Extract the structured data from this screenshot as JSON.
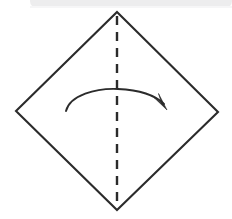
{
  "figure": {
    "title": "Origami fold step: fold square diamond in half along vertical crease",
    "canvas": {
      "width": 232,
      "height": 219,
      "background": "#ffffff"
    },
    "top_band": {
      "name": "page-edge-band",
      "description": "light gray rounded scanned page edge strip along the top",
      "x": 30,
      "y": -6,
      "width": 202,
      "height": 14,
      "radius": 7,
      "color": "#ededee"
    },
    "diamond": {
      "name": "paper-square-diamond",
      "description": "square sheet of paper rotated 45 degrees",
      "stroke": "#2b2b2b",
      "stroke_width": 2.1,
      "fill": "none",
      "vertices": {
        "top": [
          117,
          12
        ],
        "right": [
          218,
          112
        ],
        "bottom": [
          117,
          210
        ],
        "left": [
          16,
          111
        ]
      }
    },
    "fold_line": {
      "name": "vertical-fold-crease",
      "description": "dashed vertical crease line from top vertex to bottom vertex",
      "stroke": "#2b2b2b",
      "stroke_width": 2.4,
      "dash": "9 7",
      "x": 117,
      "y_start": 16,
      "y_end": 206
    },
    "fold_arrow": {
      "name": "fold-direction-arrow",
      "description": "curved arrow sweeping from left half to right half indicating fold direction",
      "stroke": "#2b2b2b",
      "fill": "#2b2b2b",
      "direction": "left-to-right",
      "path": "M 66 111 C 70 95, 96 88, 118 89 C 140 90, 156 96, 164 104",
      "arrowhead": {
        "tip": [
          166,
          109
        ],
        "points": "166,109 156,98 162,104 159,95"
      }
    }
  }
}
